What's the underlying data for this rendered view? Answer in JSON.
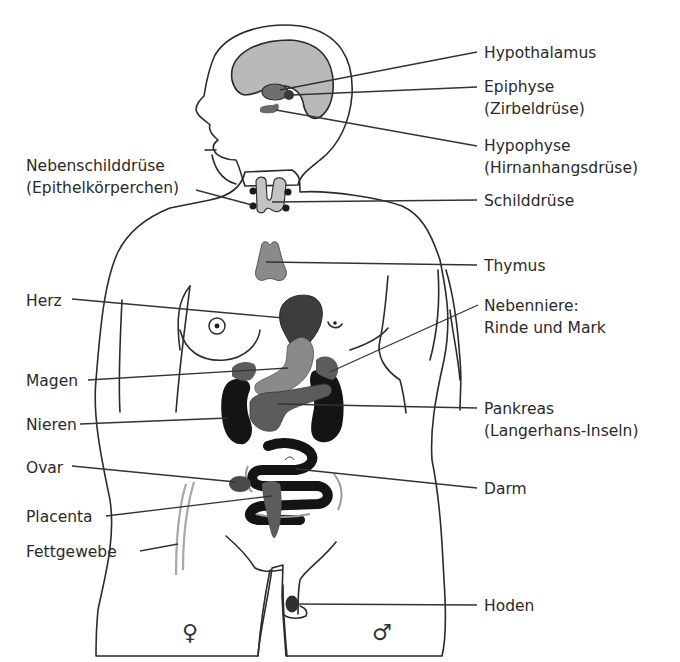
{
  "diagram": {
    "colors": {
      "skin": "#e9e9e9",
      "outline": "#2b2b2b",
      "brain": "#b9b9b9",
      "light_organ": "#c4c4c4",
      "mid_organ": "#8a8a8a",
      "dark_organ": "#5c5c5c",
      "darker_organ": "#3d3d3d",
      "black_organ": "#141414",
      "fat_tissue": "#a8a8a8"
    },
    "labels": {
      "hypothalamus": "Hypothalamus",
      "epiphyse_1": "Epiphyse",
      "epiphyse_2": "(Zirbeldrüse)",
      "hypophyse_1": "Hypophyse",
      "hypophyse_2": "(Hirnanhangsdrüse)",
      "schilddruese": "Schilddrüse",
      "nebenschild_1": "Nebenschilddrüse",
      "nebenschild_2": "(Epithelkörperchen)",
      "thymus": "Thymus",
      "herz": "Herz",
      "nebenniere_1": "Nebenniere:",
      "nebenniere_2": "Rinde und Mark",
      "magen": "Magen",
      "nieren": "Nieren",
      "pankreas_1": "Pankreas",
      "pankreas_2": "(Langerhans-Inseln)",
      "ovar": "Ovar",
      "darm": "Darm",
      "placenta": "Placenta",
      "fettgewebe": "Fettgewebe",
      "hoden": "Hoden"
    },
    "symbols": {
      "female": "♀",
      "male": "♂"
    }
  }
}
